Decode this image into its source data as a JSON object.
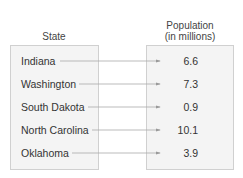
{
  "headers": {
    "domain": "State",
    "range_line1": "Population",
    "range_line2": "(in millions)"
  },
  "rows": [
    {
      "state": "Indiana",
      "population": "6.6"
    },
    {
      "state": "Washington",
      "population": "7.3"
    },
    {
      "state": "South Dakota",
      "population": "0.9"
    },
    {
      "state": "North Carolina",
      "population": "10.1"
    },
    {
      "state": "Oklahoma",
      "population": "3.9"
    }
  ]
}
